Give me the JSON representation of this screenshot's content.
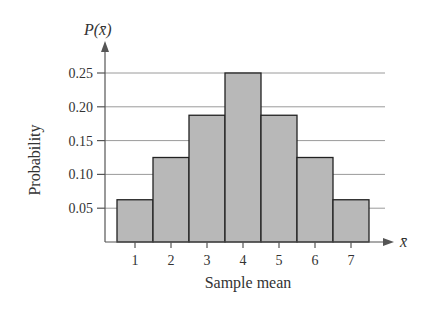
{
  "chart_data": {
    "type": "bar",
    "title": "",
    "xlabel": "Sample mean",
    "ylabel": "Probability",
    "y_axis_symbol": "P(x̄)",
    "x_axis_symbol": "x̄",
    "categories": [
      "1",
      "2",
      "3",
      "4",
      "5",
      "6",
      "7"
    ],
    "values": [
      0.0625,
      0.125,
      0.1875,
      0.25,
      0.1875,
      0.125,
      0.0625
    ],
    "yticks": [
      "0.05",
      "0.10",
      "0.15",
      "0.20",
      "0.25"
    ],
    "ytick_values": [
      0.05,
      0.1,
      0.15,
      0.2,
      0.25
    ],
    "ylim": [
      0,
      0.28
    ],
    "grid": true,
    "legend": null,
    "bar_color": "#b8b8b8",
    "bar_edge_color": "#222222",
    "grid_color": "#9a9a9a"
  }
}
